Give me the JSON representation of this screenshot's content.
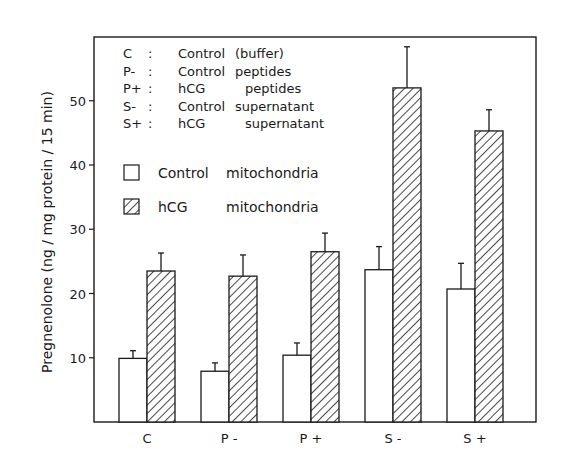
{
  "chart_data": {
    "type": "bar",
    "title": "",
    "xlabel": "",
    "ylabel": "Pregnenolone (ng / mg protein / 15 min)",
    "ylim": [
      0,
      60
    ],
    "yticks": [
      10,
      20,
      30,
      40,
      50
    ],
    "grid": false,
    "legend_position": "upper-left inside plot",
    "categories": [
      "C",
      "P-",
      "P+",
      "S-",
      "S+"
    ],
    "series": [
      {
        "name": "Control mitochondria",
        "fill": "open",
        "values": [
          9.9,
          7.9,
          10.4,
          23.7,
          20.7
        ],
        "error_upper": [
          11.1,
          9.2,
          12.3,
          27.3,
          24.7
        ]
      },
      {
        "name": "hCG mitochondria",
        "fill": "hatched",
        "values": [
          23.5,
          22.7,
          26.5,
          52.0,
          45.3
        ],
        "error_upper": [
          26.3,
          26.0,
          29.4,
          58.4,
          48.6
        ]
      }
    ],
    "abbreviations": [
      {
        "key": "C",
        "sep": ":",
        "a": "Control",
        "b": "(buffer)"
      },
      {
        "key": "P-",
        "sep": ":",
        "a": "Control",
        "b": "peptides"
      },
      {
        "key": "P+",
        "sep": ":",
        "a": "hCG",
        "b": "peptides"
      },
      {
        "key": "S-",
        "sep": ":",
        "a": "Control",
        "b": "supernatant"
      },
      {
        "key": "S+",
        "sep": ":",
        "a": "hCG",
        "b": "supernatant"
      }
    ]
  },
  "legend": {
    "control_label_a": "Control",
    "control_label_b": "mitochondria",
    "hcg_label_a": "hCG",
    "hcg_label_b": "mitochondria"
  },
  "colors": {
    "ink": "#1a1a1a",
    "background": "#ffffff"
  }
}
